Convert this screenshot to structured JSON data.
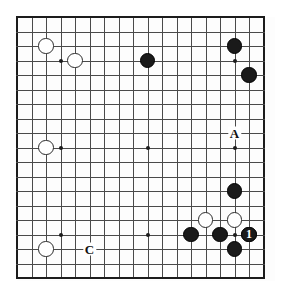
{
  "figure": {
    "kind": "go-board-diagram",
    "background_color": "#ffffff",
    "board_color": "#fdfdfd",
    "line_color": "#4a4a4a",
    "edge_color": "#1c1c1c",
    "black_color": "#1a1a1a",
    "white_color": "#ffffff"
  },
  "board": {
    "columns": 18,
    "rows": 19,
    "left": 17,
    "top": 17,
    "spacing_x": 14.5,
    "spacing_y": 14.5,
    "star_points": [
      {
        "col": 3,
        "row": 3
      },
      {
        "col": 3,
        "row": 9
      },
      {
        "col": 3,
        "row": 15
      },
      {
        "col": 9,
        "row": 3
      },
      {
        "col": 9,
        "row": 9
      },
      {
        "col": 9,
        "row": 15
      },
      {
        "col": 15,
        "row": 3
      },
      {
        "col": 15,
        "row": 9
      },
      {
        "col": 15,
        "row": 15
      }
    ]
  },
  "stones": [
    {
      "color": "white",
      "col": 2,
      "row": 2,
      "label": ""
    },
    {
      "color": "white",
      "col": 4,
      "row": 3,
      "label": ""
    },
    {
      "color": "black",
      "col": 9,
      "row": 3,
      "label": ""
    },
    {
      "color": "black",
      "col": 15,
      "row": 2,
      "label": ""
    },
    {
      "color": "black",
      "col": 16,
      "row": 4,
      "label": ""
    },
    {
      "color": "white",
      "col": 2,
      "row": 9,
      "label": ""
    },
    {
      "color": "black",
      "col": 15,
      "row": 12,
      "label": ""
    },
    {
      "color": "white",
      "col": 13,
      "row": 14,
      "label": ""
    },
    {
      "color": "white",
      "col": 15,
      "row": 14,
      "label": ""
    },
    {
      "color": "white",
      "col": 16,
      "row": 15,
      "label": ""
    },
    {
      "color": "black",
      "col": 12,
      "row": 15,
      "label": ""
    },
    {
      "color": "black",
      "col": 14,
      "row": 15,
      "label": ""
    },
    {
      "color": "black",
      "col": 16,
      "row": 15,
      "label": "1"
    },
    {
      "color": "black",
      "col": 15,
      "row": 16,
      "label": ""
    },
    {
      "color": "white",
      "col": 2,
      "row": 16,
      "label": ""
    }
  ],
  "point_labels": [
    {
      "text": "A",
      "col": 15,
      "row": 8
    },
    {
      "text": "C",
      "col": 5,
      "row": 16
    }
  ]
}
